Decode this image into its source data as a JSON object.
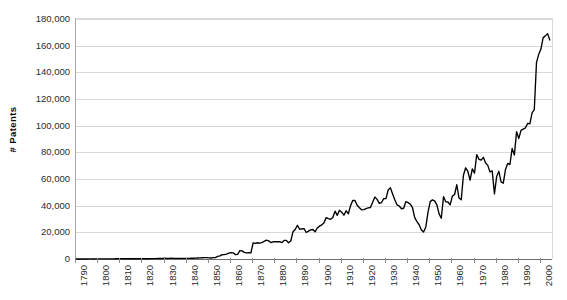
{
  "chart_data": {
    "type": "line",
    "title": "",
    "subtitle": "",
    "xlabel": "",
    "ylabel": "# Patents",
    "xlim": [
      1790,
      2005
    ],
    "ylim": [
      0,
      180000
    ],
    "grid": true,
    "legend": false,
    "legend_position": "none",
    "y_ticks": [
      0,
      20000,
      40000,
      60000,
      80000,
      100000,
      120000,
      140000,
      160000,
      180000
    ],
    "y_tick_labels": [
      "0",
      "20,000",
      "40,000",
      "60,000",
      "80,000",
      "100,000",
      "120,000",
      "140,000",
      "160,000",
      "180,000"
    ],
    "x_ticks": [
      1790,
      1800,
      1810,
      1820,
      1830,
      1840,
      1850,
      1860,
      1870,
      1880,
      1890,
      1900,
      1910,
      1920,
      1930,
      1940,
      1950,
      1960,
      1970,
      1980,
      1990,
      2000
    ],
    "x_tick_labels": [
      "1790",
      "1800",
      "1810",
      "1820",
      "1830",
      "1840",
      "1850",
      "1860",
      "1870",
      "1880",
      "1890",
      "1900",
      "1910",
      "1920",
      "1930",
      "1940",
      "1950",
      "1960",
      "1970",
      "1980",
      "1990",
      "2000"
    ],
    "line_color": "#000000",
    "grid_color": "#d9d9d9",
    "axis_color": "#6e6e6e",
    "series": [
      {
        "name": "# Patents",
        "x": [
          1790,
          1791,
          1792,
          1793,
          1794,
          1795,
          1796,
          1797,
          1798,
          1799,
          1800,
          1801,
          1802,
          1803,
          1804,
          1805,
          1806,
          1807,
          1808,
          1809,
          1810,
          1811,
          1812,
          1813,
          1814,
          1815,
          1816,
          1817,
          1818,
          1819,
          1820,
          1821,
          1822,
          1823,
          1824,
          1825,
          1826,
          1827,
          1828,
          1829,
          1830,
          1831,
          1832,
          1833,
          1834,
          1835,
          1836,
          1837,
          1838,
          1839,
          1840,
          1841,
          1842,
          1843,
          1844,
          1845,
          1846,
          1847,
          1848,
          1849,
          1850,
          1851,
          1852,
          1853,
          1854,
          1855,
          1856,
          1857,
          1858,
          1859,
          1860,
          1861,
          1862,
          1863,
          1864,
          1865,
          1866,
          1867,
          1868,
          1869,
          1870,
          1871,
          1872,
          1873,
          1874,
          1875,
          1876,
          1877,
          1878,
          1879,
          1880,
          1881,
          1882,
          1883,
          1884,
          1885,
          1886,
          1887,
          1888,
          1889,
          1890,
          1891,
          1892,
          1893,
          1894,
          1895,
          1896,
          1897,
          1898,
          1899,
          1900,
          1901,
          1902,
          1903,
          1904,
          1905,
          1906,
          1907,
          1908,
          1909,
          1910,
          1911,
          1912,
          1913,
          1914,
          1915,
          1916,
          1917,
          1918,
          1919,
          1920,
          1921,
          1922,
          1923,
          1924,
          1925,
          1926,
          1927,
          1928,
          1929,
          1930,
          1931,
          1932,
          1933,
          1934,
          1935,
          1936,
          1937,
          1938,
          1939,
          1940,
          1941,
          1942,
          1943,
          1944,
          1945,
          1946,
          1947,
          1948,
          1949,
          1950,
          1951,
          1952,
          1953,
          1954,
          1955,
          1956,
          1957,
          1958,
          1959,
          1960,
          1961,
          1962,
          1963,
          1964,
          1965,
          1966,
          1967,
          1968,
          1969,
          1970,
          1971,
          1972,
          1973,
          1974,
          1975,
          1976,
          1977,
          1978,
          1979,
          1980,
          1981,
          1982,
          1983,
          1984,
          1985,
          1986,
          1987,
          1988,
          1989,
          1990,
          1991,
          1992,
          1993,
          1994,
          1995,
          1996,
          1997,
          1998,
          1999,
          2000,
          2001,
          2002,
          2003,
          2004
        ],
        "values": [
          3,
          33,
          11,
          20,
          22,
          12,
          44,
          51,
          28,
          44,
          41,
          44,
          65,
          97,
          84,
          57,
          63,
          99,
          158,
          203,
          223,
          215,
          238,
          181,
          210,
          173,
          206,
          174,
          222,
          156,
          155,
          168,
          200,
          173,
          228,
          304,
          323,
          356,
          368,
          368,
          544,
          502,
          517,
          531,
          502,
          490,
          478,
          502,
          519,
          425,
          473,
          495,
          533,
          588,
          607,
          752,
          885,
          955,
          993,
          1020,
          883,
          752,
          1020,
          1063,
          1955,
          2315,
          3214,
          3277,
          3710,
          4357,
          4819,
          4643,
          3268,
          3521,
          6220,
          6088,
          5020,
          4643,
          4819,
          4643,
          12137,
          11659,
          12180,
          11871,
          12230,
          13291,
          14169,
          13612,
          12345,
          12925,
          12926,
          12957,
          13023,
          12280,
          13946,
          13947,
          12137,
          13500,
          20404,
          22098,
          25322,
          22312,
          22661,
          22768,
          19875,
          20856,
          21867,
          22098,
          20404,
          23278,
          24656,
          25546,
          27119,
          31029,
          30258,
          29775,
          31170,
          35859,
          32735,
          36561,
          35141,
          32856,
          36198,
          33917,
          39892,
          43892,
          43892,
          40258,
          38452,
          36887,
          37060,
          37798,
          38369,
          38616,
          42584,
          46432,
          44733,
          41717,
          42357,
          45267,
          45226,
          51756,
          53504,
          48807,
          44429,
          40618,
          39760,
          37680,
          38073,
          43073,
          42238,
          41109,
          38449,
          31057,
          28047,
          25695,
          21819,
          20190,
          23963,
          35131,
          43040,
          44326,
          43617,
          40556,
          33809,
          30535,
          46817,
          42873,
          42747,
          40652,
          47170,
          48368,
          55691,
          45679,
          44389,
          62857,
          68405,
          65652,
          59102,
          67560,
          64427,
          78317,
          74810,
          74143,
          76278,
          72000,
          70226,
          65269,
          66102,
          48854,
          61819,
          65771,
          57889,
          56860,
          67200,
          71661,
          70860,
          82952,
          77924,
          95537,
          90365,
          96511,
          97444,
          98342,
          101676,
          101419,
          109646,
          111984,
          147517,
          153486,
          157495,
          166035,
          167332,
          169023,
          164290
        ],
        "peak_value": 169023,
        "peak_year": 2003,
        "min_value": 3,
        "min_year": 1790,
        "final_value": 164290,
        "final_year": 2004
      }
    ]
  }
}
